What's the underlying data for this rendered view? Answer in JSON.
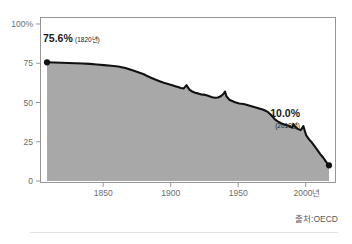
{
  "source_note": "출처:OECD",
  "callouts": {
    "start": {
      "value": "75.6%",
      "year": "(1820년)"
    },
    "end": {
      "value": "10.0%",
      "year": "(2018년)"
    }
  },
  "colors": {
    "area_fill": "#a8a8a8",
    "line": "#111111",
    "frame": "#8c8c8c",
    "tick_text": "#6d6d6d",
    "callout_text": "#1a1a1a",
    "source_text": "#55595e",
    "divider": "#e2e2e2",
    "background": "#ffffff"
  },
  "chart_data": {
    "type": "area",
    "title": "",
    "subtitle": "",
    "xlabel": "",
    "ylabel": "",
    "xlim": [
      1820,
      2018
    ],
    "ylim": [
      0,
      100
    ],
    "grid": false,
    "legend": "none",
    "y_ticks": [
      0,
      25,
      50,
      75,
      100
    ],
    "y_tick_labels": [
      "0",
      "25",
      "50",
      "75",
      "100%"
    ],
    "x_ticks": [
      1850,
      1900,
      1950,
      2000
    ],
    "x_tick_labels": [
      "1850",
      "1900",
      "1950",
      "2000년"
    ],
    "markers": [
      {
        "x": 1820,
        "y": 75.6,
        "label": "75.6%"
      },
      {
        "x": 2018,
        "y": 10.0,
        "label": "10.0%"
      }
    ],
    "x": [
      1820,
      1825,
      1830,
      1835,
      1840,
      1845,
      1850,
      1855,
      1860,
      1865,
      1870,
      1875,
      1880,
      1885,
      1888,
      1890,
      1893,
      1896,
      1899,
      1902,
      1905,
      1908,
      1910,
      1912,
      1914,
      1916,
      1918,
      1920,
      1922,
      1924,
      1926,
      1928,
      1930,
      1932,
      1934,
      1936,
      1938,
      1940,
      1942,
      1944,
      1945,
      1946,
      1948,
      1950,
      1952,
      1955,
      1958,
      1960,
      1963,
      1966,
      1969,
      1972,
      1975,
      1978,
      1980,
      1982,
      1984,
      1986,
      1988,
      1990,
      1992,
      1993,
      1994,
      1996,
      1998,
      1999,
      2000,
      2001,
      2002,
      2004,
      2006,
      2008,
      2010,
      2012,
      2014,
      2016,
      2018
    ],
    "values": [
      75.6,
      75.5,
      75.3,
      75.2,
      75.0,
      74.8,
      74.6,
      74.2,
      73.8,
      73.4,
      72.9,
      72.0,
      70.5,
      69.0,
      68.0,
      67.0,
      65.8,
      64.6,
      63.6,
      62.6,
      61.8,
      61.0,
      60.4,
      59.8,
      59.2,
      59.0,
      61.0,
      58.2,
      57.0,
      56.2,
      55.8,
      55.2,
      55.0,
      54.6,
      54.0,
      53.4,
      53.0,
      53.2,
      54.0,
      55.6,
      57.0,
      54.0,
      51.8,
      51.0,
      50.2,
      49.4,
      49.0,
      48.5,
      47.8,
      47.0,
      46.2,
      45.4,
      44.0,
      41.5,
      39.2,
      38.0,
      37.0,
      36.2,
      35.6,
      35.0,
      34.0,
      36.2,
      34.8,
      33.2,
      32.4,
      33.4,
      35.0,
      32.0,
      29.0,
      26.5,
      24.5,
      22.0,
      19.5,
      17.0,
      14.8,
      12.2,
      10.0
    ]
  }
}
